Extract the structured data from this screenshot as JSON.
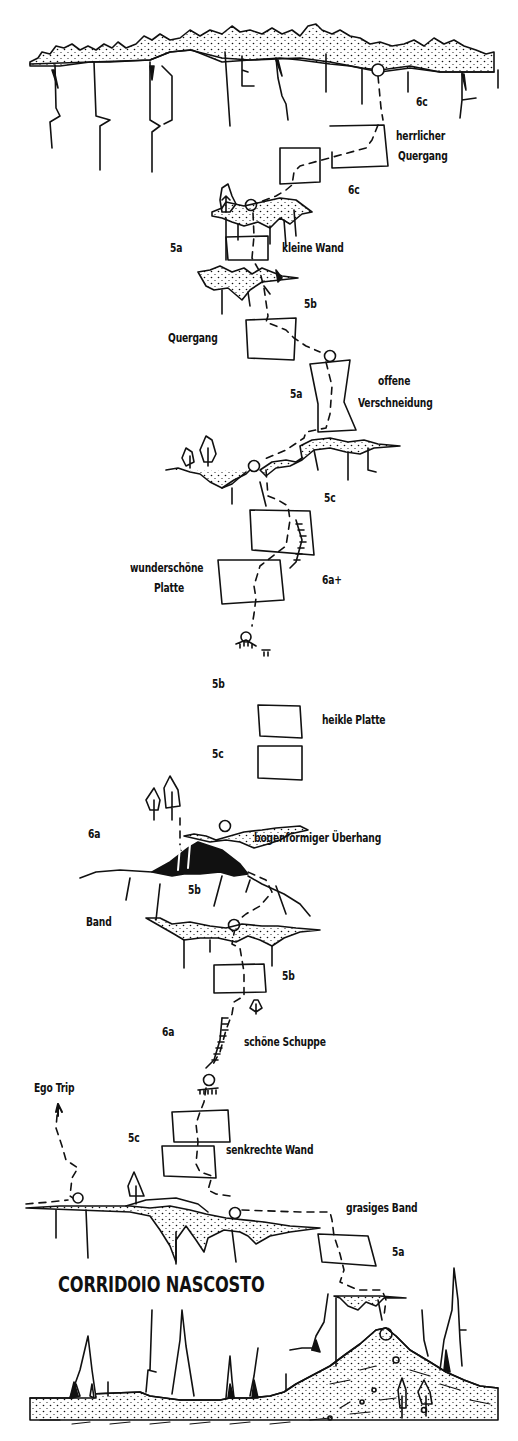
{
  "diagram": {
    "type": "climbing-topo",
    "title": "CORRIDOIO NASCOSTO",
    "colors": {
      "ink": "#111111",
      "background": "#ffffff"
    },
    "pitches_top_to_bottom": [
      {
        "grade": "6c",
        "feature": "herrlicher Quergang"
      },
      {
        "grade": "6c",
        "feature": ""
      },
      {
        "grade": "5a",
        "feature": "kleine Wand"
      },
      {
        "grade": "5b",
        "feature": ""
      },
      {
        "grade": "",
        "feature": "Quergang"
      },
      {
        "grade": "5a",
        "feature": "offene Verschneidung"
      },
      {
        "grade": "5c",
        "feature": ""
      },
      {
        "grade": "6a+",
        "feature": "wunderschöne Platte"
      },
      {
        "grade": "5b",
        "feature": "heikle Platte"
      },
      {
        "grade": "5c",
        "feature": ""
      },
      {
        "grade": "6a",
        "feature": "bogenförmiger Überhang"
      },
      {
        "grade": "5b",
        "feature": "Band"
      },
      {
        "grade": "5b",
        "feature": ""
      },
      {
        "grade": "6a",
        "feature": "schöne Schuppe"
      },
      {
        "grade": "5c",
        "feature": "senkrechte Wand"
      },
      {
        "grade": "",
        "feature": "grasiges Band"
      },
      {
        "grade": "5a",
        "feature": ""
      }
    ],
    "labels": {
      "g_6c_top": "6c",
      "herrlicher_1": "herrlicher",
      "herrlicher_2": "Quergang",
      "g_6c_2": "6c",
      "g_5a_1": "5a",
      "kleine_wand": "kleine Wand",
      "g_5b_1": "5b",
      "quergang": "Quergang",
      "g_5a_2": "5a",
      "offene_1": "offene",
      "offene_2": "Verschneidung",
      "g_5c_1": "5c",
      "wunder_1": "wunderschöne",
      "wunder_2": "Platte",
      "g_6a_plus": "6a+",
      "g_5b_2": "5b",
      "heikle": "heikle Platte",
      "g_5c_2": "5c",
      "g_6a_1": "6a",
      "bogen": "bogenförmiger Überhang",
      "g_5b_3": "5b",
      "band": "Band",
      "g_5b_4": "5b",
      "g_6a_2": "6a",
      "schuppe": "schöne Schuppe",
      "ego_trip": "Ego Trip",
      "g_5c_3": "5c",
      "senkrechte": "senkrechte Wand",
      "grasiges": "grasiges Band",
      "g_5a_3": "5a"
    }
  }
}
